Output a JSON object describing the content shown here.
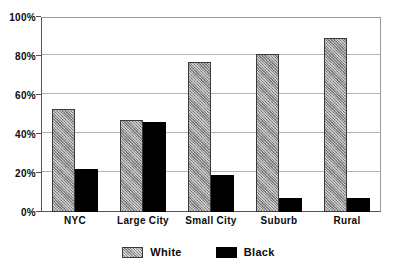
{
  "chart_data": {
    "type": "bar",
    "title": "",
    "xlabel": "",
    "ylabel": "",
    "categories": [
      "NYC",
      "Large City",
      "Small City",
      "Suburb",
      "Rural"
    ],
    "series": [
      {
        "name": "White",
        "color": "#8f8f8f",
        "values": [
          53,
          47,
          77,
          81,
          89
        ]
      },
      {
        "name": "Black",
        "color": "#000000",
        "values": [
          22,
          46,
          19,
          7,
          7
        ]
      }
    ],
    "ylim": [
      0,
      100
    ],
    "yticks": [
      0,
      20,
      40,
      60,
      80,
      100
    ],
    "ytick_labels": [
      "0%",
      "20%",
      "40%",
      "60%",
      "80%",
      "100%"
    ],
    "grid": "horizontal",
    "legend_position": "bottom-center",
    "legend_entries": [
      "White",
      "Black"
    ]
  }
}
